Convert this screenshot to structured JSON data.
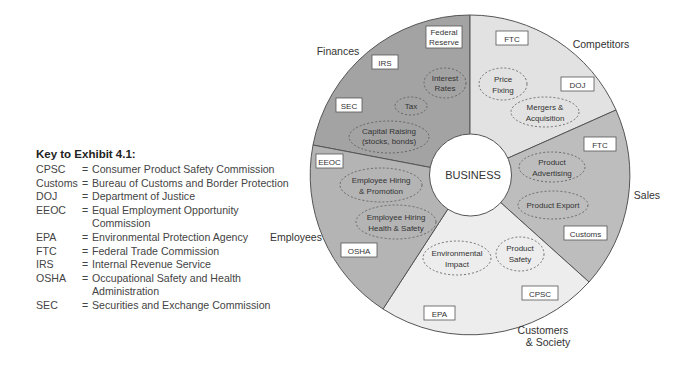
{
  "key": {
    "title": "Key to Exhibit 4.1:",
    "entries": [
      {
        "abbr": "CPSC",
        "def": "Consumer Product Safety Commission"
      },
      {
        "abbr": "Customs",
        "def": "Bureau of Customs and Border Protection"
      },
      {
        "abbr": "DOJ",
        "def": "Department of Justice"
      },
      {
        "abbr": "EEOC",
        "def": "Equal Employment Opportunity Commission"
      },
      {
        "abbr": "EPA",
        "def": "Environmental Protection Agency"
      },
      {
        "abbr": "FTC",
        "def": "Federal Trade Commission"
      },
      {
        "abbr": "IRS",
        "def": "Internal Revenue Service"
      },
      {
        "abbr": "OSHA",
        "def": "Occupational Safety and Health Administration"
      },
      {
        "abbr": "SEC",
        "def": "Securities and Exchange Commission"
      }
    ],
    "eq": "="
  },
  "diagram": {
    "center": "BUSINESS",
    "sectors": {
      "finances": {
        "label": "Finances",
        "color": "#a3a3a3",
        "agencies": [
          "Federal",
          "Reserve",
          "IRS",
          "SEC"
        ],
        "issues": [
          "Interest",
          "Rates",
          "Tax",
          "Capital Raising",
          "(stocks, bonds)"
        ]
      },
      "competitors": {
        "label": "Competitors",
        "color": "#e2e2e2",
        "agencies": [
          "FTC",
          "DOJ"
        ],
        "issues": [
          "Price",
          "Fixing",
          "Mergers &",
          "Acquisition"
        ]
      },
      "sales": {
        "label": "Sales",
        "color": "#bdbdbd",
        "agencies": [
          "FTC",
          "Customs"
        ],
        "issues": [
          "Product",
          "Advertising",
          "Product Export"
        ]
      },
      "customers": {
        "label_line1": "Customers",
        "label_line2": "& Society",
        "color": "#ededed",
        "agencies": [
          "CPSC",
          "EPA"
        ],
        "issues": [
          "Environmental",
          "Impact",
          "Product",
          "Safety"
        ]
      },
      "employees": {
        "label": "Employees",
        "color": "#b4b4b4",
        "agencies": [
          "EEOC",
          "OSHA"
        ],
        "issues": [
          "Employee Hiring",
          "& Promotion",
          "Employee Hiring",
          "Health & Safety"
        ]
      }
    }
  }
}
